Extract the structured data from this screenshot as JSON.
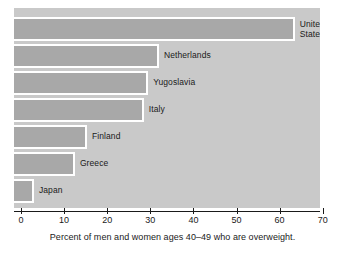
{
  "figure": {
    "top_clipped_text": "",
    "caption": "Percent of men and women ages 40–49 who are overweight."
  },
  "colors": {
    "bar_fill": "#a8a8a8",
    "plot_background": "#c9c9c9",
    "bar_outline": "#ffffff",
    "axis": "#1a1a1a",
    "text": "#1a1a1a",
    "page_background": "#ffffff"
  },
  "chart_data": {
    "type": "bar",
    "orientation": "horizontal",
    "title": "",
    "subtitle": "",
    "xlabel": "Percent of men and women ages 40–49 who are overweight.",
    "ylabel": "",
    "categories": [
      "United States",
      "Netherlands",
      "Yugoslavia",
      "Italy",
      "Finland",
      "Greece",
      "Japan"
    ],
    "values": [
      63.5,
      32,
      29.5,
      28.5,
      15.3,
      12.5,
      3
    ],
    "xlim": [
      0,
      70
    ],
    "ylim": null,
    "xticks": [
      0,
      10,
      20,
      30,
      40,
      50,
      60,
      70
    ],
    "xtick_labels": [
      "0",
      "10",
      "20",
      "30",
      "40",
      "50",
      "60",
      "70"
    ],
    "grid": false,
    "legend": null,
    "annotations": [],
    "bars": [
      {
        "label": "United States",
        "label_lines": "United\nStates",
        "value": 63.5,
        "label_inside": false
      },
      {
        "label": "Netherlands",
        "label_lines": "Netherlands",
        "value": 32,
        "label_inside": false
      },
      {
        "label": "Yugoslavia",
        "label_lines": "Yugoslavia",
        "value": 29.5,
        "label_inside": false
      },
      {
        "label": "Italy",
        "label_lines": "Italy",
        "value": 28.5,
        "label_inside": false
      },
      {
        "label": "Finland",
        "label_lines": "Finland",
        "value": 15.3,
        "label_inside": false
      },
      {
        "label": "Greece",
        "label_lines": "Greece",
        "value": 12.5,
        "label_inside": false
      },
      {
        "label": "Japan",
        "label_lines": "Japan",
        "value": 3,
        "label_inside": false
      }
    ]
  }
}
